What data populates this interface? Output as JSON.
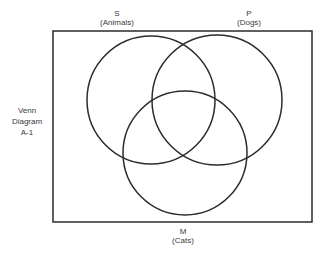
{
  "diagram": {
    "type": "venn",
    "title_lines": [
      "Venn",
      "Diagram",
      "A-1"
    ],
    "universe": {
      "x": 53,
      "y": 31,
      "width": 259,
      "height": 191,
      "stroke": "#2b2b2b"
    },
    "sets": [
      {
        "letter": "S",
        "name": "(Animals)",
        "cx": 151,
        "cy": 100,
        "r": 64,
        "stroke": "#2b2b2b"
      },
      {
        "letter": "P",
        "name": "(Dogs)",
        "cx": 217,
        "cy": 100,
        "r": 65,
        "stroke": "#2b2b2b"
      },
      {
        "letter": "M",
        "name": "(Cats)",
        "cx": 185,
        "cy": 153,
        "r": 62,
        "stroke": "#2b2b2b"
      }
    ]
  }
}
